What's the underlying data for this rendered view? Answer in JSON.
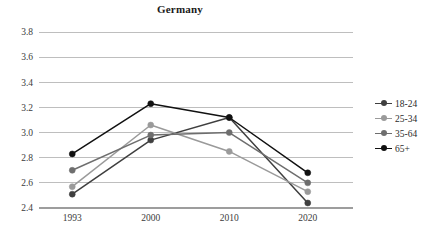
{
  "chart_data": {
    "type": "line",
    "title": "Germany",
    "xlabel": "",
    "ylabel": "",
    "categories": [
      "1993",
      "2000",
      "2010",
      "2020"
    ],
    "x": [
      1993,
      2000,
      2010,
      2020
    ],
    "ylim": [
      2.4,
      3.8
    ],
    "yticks": [
      "2.4",
      "2.6",
      "2.8",
      "3.0",
      "3.2",
      "3.4",
      "3.6",
      "3.8"
    ],
    "ytick_values": [
      2.4,
      2.6,
      2.8,
      3.0,
      3.2,
      3.4,
      3.6,
      3.8
    ],
    "grid": true,
    "legend_position": "right",
    "series": [
      {
        "name": "18-24",
        "color": "#3f3f3f",
        "values": [
          2.51,
          2.94,
          3.12,
          2.44
        ]
      },
      {
        "name": "25-34",
        "color": "#9a9a9a",
        "values": [
          2.57,
          3.06,
          2.85,
          2.53
        ]
      },
      {
        "name": "35-64",
        "color": "#6e6e6e",
        "values": [
          2.7,
          2.98,
          3.0,
          2.6
        ]
      },
      {
        "name": "65+",
        "color": "#111111",
        "values": [
          2.83,
          3.23,
          3.12,
          2.68
        ]
      }
    ]
  },
  "caption": {
    "text": ""
  },
  "colors": {
    "gridline": "#b7b7b7",
    "axis": "#9d9d9d",
    "background": "#ffffff",
    "tick_text": "#3b3b3b",
    "title_text": "#1a1a1a"
  }
}
